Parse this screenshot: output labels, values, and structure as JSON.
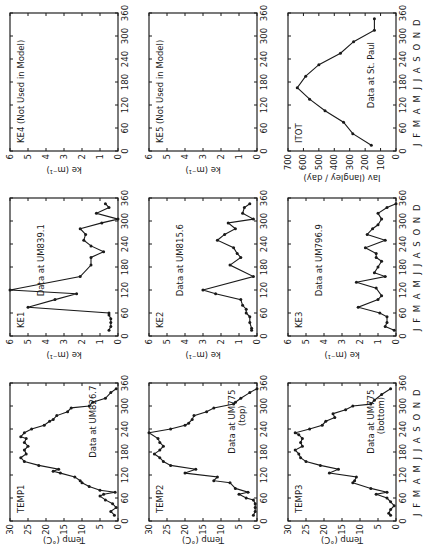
{
  "figure": {
    "orientation": "rotated 90 degrees counter-clockwise",
    "month_labels": "J F M A M J J A S O N D",
    "x_ticks": [
      0,
      60,
      120,
      180,
      240,
      300,
      360
    ],
    "colors": {
      "line": "#1a1a1a",
      "marker": "#1a1a1a",
      "frame": "#222222",
      "background": "#ffffff"
    }
  },
  "chart_data": [
    {
      "id": "TEMP1",
      "type": "line",
      "title": "TEMP1",
      "annotation": "Data at UM826.7",
      "xlabel": "",
      "ylabel": "Temp (°C)",
      "xlim": [
        0,
        360
      ],
      "ylim": [
        0,
        30
      ],
      "yticks": [
        0,
        5,
        10,
        15,
        20,
        25,
        30
      ],
      "row": 0,
      "col": 0,
      "x": [
        15,
        25,
        35,
        45,
        55,
        65,
        70,
        75,
        80,
        90,
        100,
        105,
        115,
        125,
        130,
        135,
        145,
        155,
        165,
        175,
        185,
        195,
        205,
        215,
        220,
        230,
        240,
        250,
        260,
        265,
        275,
        285,
        295,
        300,
        310,
        320,
        335,
        345
      ],
      "y": [
        1,
        2,
        0.5,
        1.5,
        3.5,
        5,
        4,
        0.8,
        5,
        8,
        10,
        10.5,
        12,
        16,
        18,
        16.5,
        22,
        26,
        27,
        25.5,
        26,
        25,
        26,
        25.5,
        27,
        26,
        24,
        20.5,
        19,
        18,
        17,
        14,
        13,
        8,
        7,
        3.5,
        2,
        0.5
      ]
    },
    {
      "id": "KE1",
      "type": "line",
      "title": "KE1",
      "annotation": "Data at UM839.1",
      "xlabel": "",
      "ylabel": "ke (m⁻¹)",
      "xlim": [
        0,
        360
      ],
      "ylim": [
        0,
        6
      ],
      "yticks": [
        0,
        1,
        2,
        3,
        4,
        5,
        6
      ],
      "row": 0,
      "col": 1,
      "x": [
        15,
        25,
        35,
        45,
        55,
        60,
        75,
        95,
        110,
        120,
        155,
        185,
        205,
        220,
        235,
        250,
        265,
        280,
        295,
        305,
        320,
        335,
        345
      ],
      "y": [
        0.5,
        0.4,
        0.4,
        0.4,
        0.5,
        0.5,
        5,
        3.5,
        2.3,
        6,
        2.1,
        1.5,
        1.5,
        0.8,
        1.5,
        1.9,
        1.8,
        2.1,
        0.9,
        0,
        1.2,
        0.5,
        0.7
      ]
    },
    {
      "id": "KE4",
      "type": "line",
      "title": "KE4 (Not Used in Model)",
      "annotation": "",
      "xlabel": "",
      "ylabel": "ke (m⁻¹)",
      "xlim": [
        0,
        360
      ],
      "ylim": [
        0,
        6
      ],
      "yticks": [
        0,
        1,
        2,
        3,
        4,
        5,
        6
      ],
      "row": 0,
      "col": 2,
      "x": [],
      "y": []
    },
    {
      "id": "TEMP2",
      "type": "line",
      "title": "TEMP2",
      "annotation": "Data at UM775 (top)",
      "xlabel": "",
      "ylabel": "Temp (°C)",
      "xlim": [
        0,
        360
      ],
      "ylim": [
        0,
        30
      ],
      "yticks": [
        0,
        5,
        10,
        15,
        20,
        25,
        30
      ],
      "row": 1,
      "col": 0,
      "x": [
        15,
        25,
        35,
        45,
        55,
        60,
        70,
        75,
        85,
        100,
        105,
        115,
        125,
        135,
        145,
        155,
        165,
        175,
        185,
        195,
        205,
        215,
        230,
        240,
        250,
        255,
        265,
        275,
        285,
        295,
        305,
        310,
        320,
        335,
        345
      ],
      "y": [
        1,
        0.5,
        0.5,
        0.5,
        1,
        3,
        5,
        2.5,
        6,
        7.5,
        12,
        11,
        20,
        17,
        24,
        26,
        27,
        28.5,
        27,
        26,
        27,
        27.5,
        30,
        24,
        20,
        19,
        18,
        17.5,
        14,
        12,
        6.5,
        6,
        4.5,
        2,
        0
      ]
    },
    {
      "id": "KE2",
      "type": "line",
      "title": "KE2",
      "annotation": "Data at UM815.6",
      "xlabel": "",
      "ylabel": "ke (m⁻¹)",
      "xlim": [
        0,
        360
      ],
      "ylim": [
        0,
        6
      ],
      "yticks": [
        0,
        1,
        2,
        3,
        4,
        5,
        6
      ],
      "row": 1,
      "col": 1,
      "x": [
        15,
        20,
        35,
        50,
        60,
        70,
        80,
        95,
        110,
        120,
        155,
        185,
        205,
        215,
        230,
        250,
        265,
        280,
        295,
        305,
        320,
        335,
        345
      ],
      "y": [
        0.3,
        0.3,
        0.4,
        0.4,
        0.6,
        0.6,
        0.8,
        0.9,
        2.3,
        3,
        0.2,
        1.5,
        0.9,
        1.1,
        1.3,
        2.2,
        1.8,
        1.2,
        1.6,
        0.2,
        0.8,
        0.7,
        0.4
      ]
    },
    {
      "id": "KE5",
      "type": "line",
      "title": "KE5 (Not Used in Model)",
      "annotation": "",
      "xlabel": "",
      "ylabel": "ke (m⁻¹)",
      "xlim": [
        0,
        360
      ],
      "ylim": [
        0,
        6
      ],
      "yticks": [
        0,
        1,
        2,
        3,
        4,
        5,
        6
      ],
      "row": 1,
      "col": 2,
      "x": [],
      "y": []
    },
    {
      "id": "TEMP3",
      "type": "line",
      "title": "TEMP3",
      "annotation": "Data at UM775 (bottom)",
      "xlabel": "J F M A M J J A S O N D",
      "ylabel": "Temp (°C)",
      "xlim": [
        0,
        360
      ],
      "ylim": [
        0,
        30
      ],
      "yticks": [
        0,
        5,
        10,
        15,
        20,
        25,
        30
      ],
      "row": 2,
      "col": 0,
      "x": [
        15,
        20,
        30,
        40,
        50,
        60,
        70,
        75,
        85,
        100,
        105,
        115,
        125,
        135,
        145,
        155,
        165,
        175,
        185,
        195,
        205,
        215,
        225,
        230,
        240,
        250,
        260,
        270,
        280,
        290,
        300,
        305,
        315,
        330,
        345
      ],
      "y": [
        1.5,
        2,
        1.5,
        0.5,
        1.5,
        2.5,
        5.5,
        2.5,
        7,
        12,
        11.5,
        11,
        18.5,
        16,
        21,
        25,
        26.5,
        27,
        28,
        26,
        26.5,
        26,
        27,
        28,
        24,
        20.5,
        19.5,
        17,
        17.5,
        14,
        12,
        7,
        6,
        4,
        1.5
      ]
    },
    {
      "id": "KE3",
      "type": "line",
      "title": "KE3",
      "annotation": "Data at UM796.9",
      "xlabel": "J F M A M J J A S O N D",
      "ylabel": "ke (m⁻¹)",
      "xlim": [
        0,
        360
      ],
      "ylim": [
        0,
        6
      ],
      "yticks": [
        0,
        1,
        2,
        3,
        4,
        5,
        6
      ],
      "row": 2,
      "col": 1,
      "x": [
        15,
        25,
        35,
        50,
        60,
        75,
        95,
        105,
        125,
        140,
        155,
        165,
        180,
        195,
        205,
        215,
        230,
        250,
        265,
        280,
        290,
        305,
        320,
        335,
        345
      ],
      "y": [
        0.1,
        0.6,
        0.5,
        0.5,
        0.9,
        2.1,
        1.0,
        0.8,
        1.1,
        2.2,
        0.6,
        1.2,
        1.0,
        0.8,
        1.1,
        1.1,
        1.7,
        0.6,
        1.6,
        1.3,
        1.0,
        0.8,
        1.0,
        0.5,
        0
      ]
    },
    {
      "id": "ITOT",
      "type": "line",
      "title": "ITOT",
      "annotation": "Data at St. Paul",
      "xlabel": "J F M A M J J A S O N D",
      "ylabel": "Iav (langley / day)",
      "xlim": [
        0,
        360
      ],
      "ylim": [
        0,
        700
      ],
      "yticks": [
        0,
        100,
        200,
        300,
        400,
        500,
        600,
        700
      ],
      "row": 2,
      "col": 2,
      "x": [
        15,
        45,
        75,
        105,
        135,
        165,
        195,
        225,
        255,
        285,
        315,
        345
      ],
      "y": [
        160,
        280,
        340,
        460,
        560,
        640,
        585,
        500,
        360,
        275,
        140,
        140
      ]
    }
  ]
}
